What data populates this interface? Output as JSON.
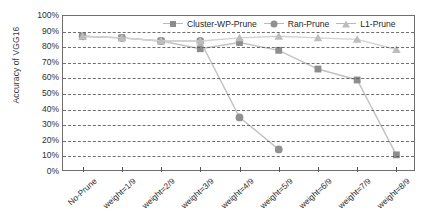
{
  "chart_data": {
    "type": "line",
    "title": "",
    "xlabel": "",
    "ylabel": "Accuracy of VGG16",
    "ylim": [
      0,
      100
    ],
    "ytick_labels": [
      "100%",
      "90%",
      "80%",
      "70%",
      "60%",
      "50%",
      "40%",
      "30%",
      "20%",
      "10%",
      "0%"
    ],
    "ytick_values": [
      100,
      90,
      80,
      70,
      60,
      50,
      40,
      30,
      20,
      10,
      0
    ],
    "grid": true,
    "legend_position": "top-right-inside",
    "categories": [
      "No-Prune",
      "weight=1/9",
      "weight=2/9",
      "weight=3/9",
      "weight=4/9",
      "weight=5/9",
      "weight=6/9",
      "weight=7/9",
      "weight=8/9"
    ],
    "series": [
      {
        "name": "Cluster-WP-Prune",
        "marker": "square",
        "color": "#8d8d8d",
        "line_color": "#c2c2c2",
        "values": [
          87,
          86,
          84,
          79,
          83,
          78,
          66,
          59,
          11
        ]
      },
      {
        "name": "Ran-Prune",
        "marker": "circle",
        "color": "#909090",
        "line_color": "#c2c2c2",
        "values": [
          87,
          86,
          84,
          84,
          35,
          14.5,
          null,
          null,
          null
        ]
      },
      {
        "name": "L1-Prune",
        "marker": "triangle",
        "color": "#bdbdbd",
        "line_color": "#d2d2d2",
        "values": [
          87,
          86,
          84,
          84,
          86,
          87,
          86,
          85,
          78.5
        ]
      }
    ]
  },
  "axis": {
    "y_title": "Accuracy of VGG16"
  },
  "legend": {
    "items": [
      {
        "label": "Cluster-WP-Prune",
        "marker": "square-marker-icon"
      },
      {
        "label": "Ran-Prune",
        "marker": "circle-marker-icon"
      },
      {
        "label": "L1-Prune",
        "marker": "triangle-marker-icon"
      }
    ]
  }
}
